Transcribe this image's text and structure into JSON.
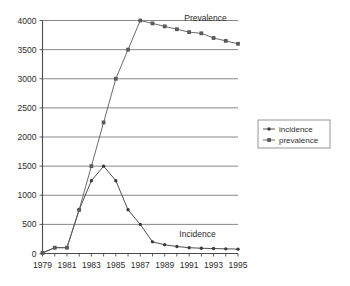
{
  "chart_data": {
    "type": "line",
    "title": "",
    "xlabel": "",
    "ylabel": "",
    "x": [
      1979,
      1980,
      1981,
      1982,
      1983,
      1984,
      1985,
      1986,
      1987,
      1988,
      1989,
      1990,
      1991,
      1992,
      1993,
      1994,
      1995
    ],
    "xlim": [
      1979,
      1995
    ],
    "ylim": [
      0,
      4000
    ],
    "grid": true,
    "legend_position": "right-outside",
    "x_tick_labels": [
      "1979",
      "1981",
      "1983",
      "1985",
      "1987",
      "1989",
      "1991",
      "1993",
      "1995"
    ],
    "x_tick_values": [
      1979,
      1981,
      1983,
      1985,
      1987,
      1989,
      1991,
      1993,
      1995
    ],
    "y_tick_labels": [
      "0",
      "500",
      "1000",
      "1500",
      "2000",
      "2500",
      "3000",
      "3500",
      "4000"
    ],
    "y_tick_values": [
      0,
      500,
      1000,
      1500,
      2000,
      2500,
      3000,
      3500,
      4000
    ],
    "series": [
      {
        "name": "incidence",
        "marker": "dot",
        "color": "#3c3c3c",
        "values": [
          10,
          100,
          100,
          750,
          1250,
          1500,
          1250,
          750,
          500,
          200,
          150,
          120,
          100,
          90,
          85,
          80,
          75
        ]
      },
      {
        "name": "prevalence",
        "marker": "square",
        "color": "#5a5a5a",
        "values": [
          10,
          100,
          100,
          750,
          1500,
          2250,
          3000,
          3500,
          4000,
          3950,
          3900,
          3850,
          3800,
          3780,
          3700,
          3650,
          3600
        ]
      }
    ],
    "annotations": [
      {
        "text": "Prevalence",
        "x": 1990.6,
        "y": 3990
      },
      {
        "text": "Incidence",
        "x": 1990.2,
        "y": 290
      }
    ]
  },
  "legend": {
    "items": [
      {
        "label": "incidence"
      },
      {
        "label": "prevalence"
      }
    ]
  }
}
